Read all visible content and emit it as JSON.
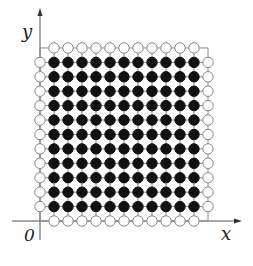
{
  "diagram": {
    "title": "",
    "axes": {
      "x_label": "x",
      "y_label": "y",
      "origin_label": "0"
    },
    "lattice": {
      "size": 13,
      "interior_filled_points": "i=1..11, j=1..11 (black)",
      "boundary_open_points": "i=0 or i=12 or j=0 or j=12, excluding corners (white)",
      "corner_points": "none drawn"
    },
    "colors": {
      "filled": "#111111",
      "open_fill": "#ffffff",
      "stroke": "#888888",
      "axis": "#555555"
    }
  }
}
